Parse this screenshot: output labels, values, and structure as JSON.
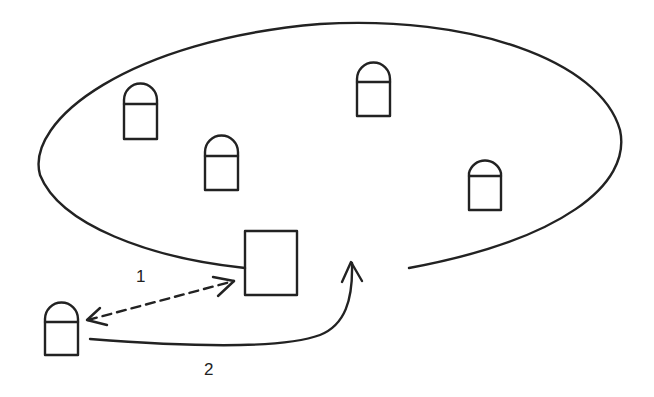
{
  "diagram": {
    "title": "",
    "colors": {
      "stroke": "#222222",
      "background": "#ffffff"
    },
    "region": {
      "shape": "open-ellipse",
      "description": "network coverage area with gap at bottom"
    },
    "nodes": [
      {
        "id": "node-a",
        "type": "arched-node",
        "inside_region": true
      },
      {
        "id": "node-b",
        "type": "arched-node",
        "inside_region": true
      },
      {
        "id": "node-c",
        "type": "arched-node",
        "inside_region": true
      },
      {
        "id": "node-d",
        "type": "arched-node",
        "inside_region": true
      },
      {
        "id": "node-outside",
        "type": "arched-node",
        "inside_region": false
      },
      {
        "id": "gateway-box",
        "type": "rectangle",
        "inside_region": "boundary"
      }
    ],
    "edges": [
      {
        "id": "edge-1",
        "label": "1",
        "style": "dashed",
        "direction": "bidirectional",
        "from": "node-outside",
        "to": "gateway-box"
      },
      {
        "id": "edge-2",
        "label": "2",
        "style": "solid-curved",
        "direction": "forward",
        "from": "node-outside",
        "to": "region-gap"
      }
    ],
    "labels": {
      "edge1": "1",
      "edge2": "2"
    }
  }
}
